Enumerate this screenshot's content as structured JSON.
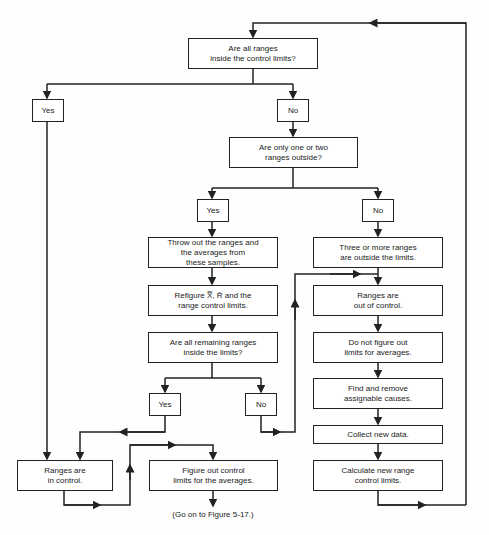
{
  "diagram": {
    "type": "flowchart",
    "nodes": {
      "q_all_inside": "Are all ranges\ninside the control limits?",
      "yes1": "Yes",
      "no1": "No",
      "q_one_two": "Are only one or two\nranges outside?",
      "yes2": "Yes",
      "no2": "No",
      "throw_out": "Throw out the ranges and\nthe averages from\nthese samples.",
      "three_more": "Three or more ranges\nare outside the limits.",
      "refigure": "Refigure X̿, R̄ and the\nrange control limits.",
      "out_of_control": "Ranges are\nout of control.",
      "q_remaining": "Are all remaining ranges\ninside the limits?",
      "do_not_figure": "Do not figure out\nlimits for averages.",
      "find_remove": "Find and remove\nassignable causes.",
      "yes3": "Yes",
      "no3": "No",
      "collect": "Collect new data.",
      "in_control": "Ranges are\nin control.",
      "figure_out": "Figure out control\nlimits for the averages.",
      "calculate": "Calculate new range\ncontrol limits."
    },
    "caption": "(Go on to Figure 5-17.)"
  }
}
